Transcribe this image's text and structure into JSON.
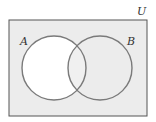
{
  "diagram": {
    "type": "venn",
    "universe_label": "U",
    "sets": [
      {
        "label": "A",
        "shaded": false
      },
      {
        "label": "B",
        "shaded": true
      }
    ],
    "intersection_shaded": true,
    "outside_shaded": true,
    "shaded_region_expression": "A' ∪ B",
    "colors": {
      "shade": "#ececec",
      "unshaded": "#ffffff",
      "stroke": "#7a7a7a",
      "border": "#555555"
    }
  }
}
